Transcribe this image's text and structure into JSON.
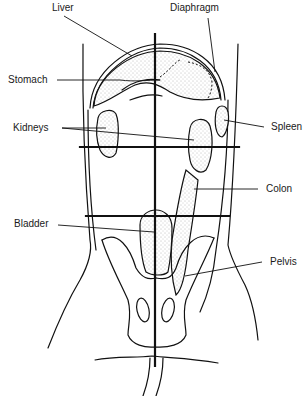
{
  "labels": {
    "liver": "Liver",
    "diaphragm": "Diaphragm",
    "stomach": "Stomach",
    "kidneys": "Kidneys",
    "spleen": "Spleen",
    "colon": "Colon",
    "bladder": "Bladder",
    "pelvis": "Pelvis"
  },
  "colors": {
    "line": "#111111",
    "background": "#ffffff",
    "stipple": "#777777"
  }
}
